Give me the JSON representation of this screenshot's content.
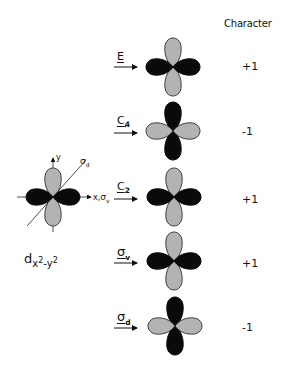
{
  "header": {
    "character_label": "Character"
  },
  "reference_orbital": {
    "label_main": "d",
    "label_sub_x": "x",
    "label_sup_1": "2",
    "label_minus": "-y",
    "label_sup_2": "2",
    "axis_y": "y",
    "axis_x": "x,",
    "axis_sigma_v": "σ",
    "axis_sigma_v_sub": "v",
    "axis_sigma_d": "σ",
    "axis_sigma_d_sub": "d"
  },
  "operations": [
    {
      "symbol": "E",
      "sub": "",
      "character": "+1",
      "vertical_lobes": "gray",
      "horizontal_lobes": "black"
    },
    {
      "symbol": "C",
      "sub": "4",
      "character": "-1",
      "vertical_lobes": "black",
      "horizontal_lobes": "gray"
    },
    {
      "symbol": "C",
      "sub": "2",
      "character": "+1",
      "vertical_lobes": "gray",
      "horizontal_lobes": "black"
    },
    {
      "symbol": "σ",
      "sub": "v",
      "character": "+1",
      "vertical_lobes": "gray",
      "horizontal_lobes": "black"
    },
    {
      "symbol": "σ",
      "sub": "d",
      "character": "-1",
      "vertical_lobes": "black",
      "horizontal_lobes": "gray"
    }
  ],
  "colors": {
    "black_lobe": "#0a0a0a",
    "gray_lobe": "#b3b3b3",
    "outline": "#1a1a1a"
  }
}
